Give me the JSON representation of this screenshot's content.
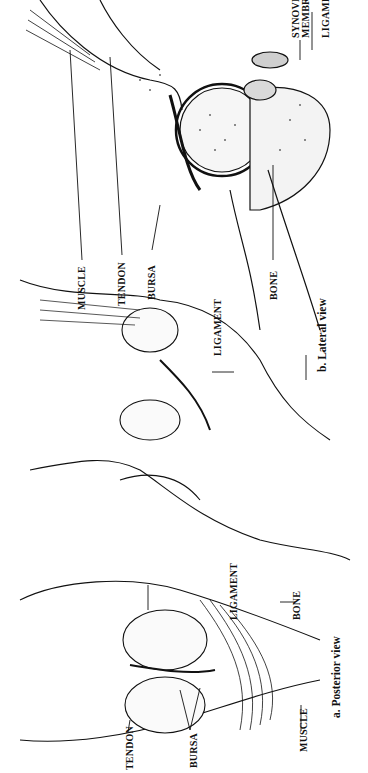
{
  "figure": {
    "orientation": "rotated 90deg counter-clockwise"
  },
  "lateral_view": {
    "caption": "b.  Lateral view",
    "labels": {
      "muscle": "MUSCLE",
      "tendon": "TENDON",
      "bursa": "BURSA",
      "ligament_front": "LIGAMENT",
      "bone": "BONE",
      "synovial_line1": "SYNOVIAL",
      "synovial_line2": "MEMBRANE",
      "ligament_top": "LIGAMENT"
    }
  },
  "posterior_view": {
    "caption": "a.  Posterior view",
    "labels": {
      "ligament": "LIGAMENT",
      "bone": "BONE",
      "tendon": "TENDON",
      "bursa": "BURSA",
      "muscle": "MUSCLE"
    }
  }
}
